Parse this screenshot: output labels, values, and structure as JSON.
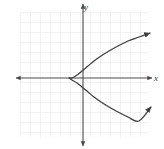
{
  "figure": {
    "width": 164,
    "height": 149,
    "background_color": "#ffffff"
  },
  "grid": {
    "visible": true,
    "line_color": "#e6e6e6",
    "cell_size": 10,
    "left": 20,
    "top": 12,
    "right": 148,
    "bottom": 137
  },
  "axes": {
    "color": "#4a4a4a",
    "origin_x": 83,
    "origin_y": 78,
    "x_axis": {
      "label": "x",
      "label_x": 156,
      "label_y": 81,
      "start_x": 16,
      "end_x": 152,
      "y": 78,
      "arrow_start": true,
      "arrow_end": true
    },
    "y_axis": {
      "label": "y",
      "label_x": 86,
      "label_y": 10,
      "start_y": 4,
      "end_y": 146,
      "x": 83,
      "arrow_start": true,
      "arrow_end": true
    },
    "tick_labels": []
  },
  "chart_data": {
    "type": "line",
    "title": "",
    "xlabel": "x",
    "ylabel": "y",
    "grid": true,
    "legend": null,
    "curve_name": "leftward-opening parabola",
    "equation_form": "x = a(y - k)^2 + h",
    "orientation": "opens right",
    "vertex": {
      "pixel_x": 69,
      "pixel_y": 78,
      "graph_x": -1.4,
      "graph_y": 0
    },
    "color": "#3f3f3f",
    "line_width": 1.3,
    "arrow_upper": {
      "pixel_x": 150,
      "pixel_y": 33
    },
    "arrow_lower": {
      "pixel_x": 151,
      "pixel_y": 107
    },
    "points_pixel": [
      [
        150,
        33
      ],
      [
        139,
        37
      ],
      [
        128,
        41
      ],
      [
        118,
        46
      ],
      [
        109,
        51
      ],
      [
        101,
        56
      ],
      [
        94,
        61
      ],
      [
        88,
        66
      ],
      [
        82,
        71
      ],
      [
        77,
        75
      ],
      [
        72,
        78
      ],
      [
        69,
        78
      ],
      [
        72,
        80
      ],
      [
        77,
        83
      ],
      [
        82,
        87
      ],
      [
        88,
        92
      ],
      [
        94,
        97
      ],
      [
        101,
        102
      ],
      [
        109,
        107
      ],
      [
        118,
        112
      ],
      [
        128,
        117
      ],
      [
        139,
        121
      ],
      [
        151,
        107
      ]
    ],
    "series": [
      {
        "name": "parabola",
        "x": [
          -1.4,
          -0.9,
          0.1,
          1.1,
          2.1,
          3.1,
          4.1,
          5.1,
          6.1,
          6.7
        ],
        "y_upper": [
          0,
          0.7,
          1.2,
          1.7,
          2.2,
          2.7,
          3.2,
          3.7,
          4.2,
          4.5
        ],
        "y_lower": [
          0,
          -0.7,
          -1.2,
          -1.7,
          -2.2,
          -2.7,
          -3.2,
          -3.7,
          -4.2,
          -4.5
        ]
      }
    ],
    "xlim": [
      -6.3,
      6.5
    ],
    "ylim": [
      -5.9,
      6.6
    ]
  }
}
